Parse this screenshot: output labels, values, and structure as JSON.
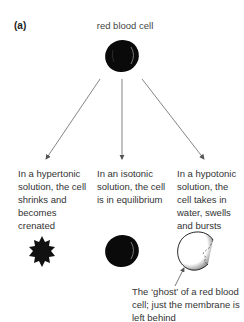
{
  "panel": {
    "label": "(a)"
  },
  "title": "red blood cell",
  "outcomes": [
    {
      "condition": "hypertonic",
      "description": "In a hypertonic solution, the cell shrinks and becomes crenated",
      "cell_state": "crenated"
    },
    {
      "condition": "isotonic",
      "description": "In an isotonic solution, the cell is in equilibrium",
      "cell_state": "normal"
    },
    {
      "condition": "hypotonic",
      "description": "In a hypotonic solution, the cell takes in water, swells and bursts",
      "cell_state": "burst"
    }
  ],
  "ghost_note": "The ‘ghost’ of a red blood cell; just the membrane is left behind",
  "colors": {
    "cell": "#0a0a0a",
    "arrow": "#666666",
    "text": "#333333"
  }
}
